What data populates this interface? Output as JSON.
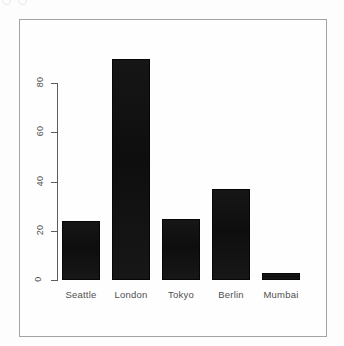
{
  "chart_data": {
    "type": "bar",
    "title": "",
    "xlabel": "",
    "ylabel": "",
    "categories": [
      "Seattle",
      "London",
      "Tokyo",
      "Berlin",
      "Mumbai"
    ],
    "values": [
      24,
      90,
      25,
      37,
      3
    ],
    "yticks": [
      0,
      20,
      40,
      60,
      80
    ],
    "ylim": [
      0,
      90
    ],
    "grid": false,
    "legend": "none",
    "bar_color": "#111111",
    "frame_border_color": "#a3a3a3",
    "axis_color": "#5d5d5d",
    "label_color": "#4f4f4f"
  }
}
